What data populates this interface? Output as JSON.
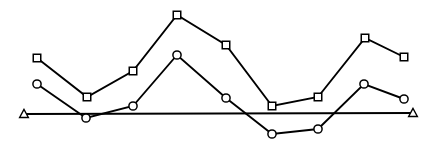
{
  "chart_data": {
    "type": "line",
    "title": "",
    "subtitle": "",
    "xlabel": "",
    "ylabel": "",
    "xlim": [
      0,
      437
    ],
    "ylim": [
      147,
      0
    ],
    "grid": false,
    "legend": "none",
    "axis_visible": false,
    "tick_labels_x": [],
    "tick_labels_y": [],
    "annotations": [],
    "background_color": "#ffffff",
    "line_color": "#000000",
    "marker_fill": "#ffffff",
    "series": [
      {
        "name": "series-squares",
        "marker": "square",
        "color": "#000000",
        "points": [
          {
            "x": 37,
            "y": 58
          },
          {
            "x": 87,
            "y": 97
          },
          {
            "x": 133,
            "y": 71
          },
          {
            "x": 177,
            "y": 15
          },
          {
            "x": 226,
            "y": 45
          },
          {
            "x": 272,
            "y": 106
          },
          {
            "x": 318,
            "y": 97
          },
          {
            "x": 365,
            "y": 38
          },
          {
            "x": 404,
            "y": 57
          }
        ],
        "values": [
          56,
          17,
          43,
          99,
          69,
          8,
          17,
          76,
          57
        ]
      },
      {
        "name": "series-circles",
        "marker": "circle",
        "color": "#000000",
        "points": [
          {
            "x": 37,
            "y": 84
          },
          {
            "x": 86,
            "y": 118
          },
          {
            "x": 133,
            "y": 106
          },
          {
            "x": 177,
            "y": 55
          },
          {
            "x": 226,
            "y": 98
          },
          {
            "x": 272,
            "y": 134
          },
          {
            "x": 318,
            "y": 129
          },
          {
            "x": 364,
            "y": 84
          },
          {
            "x": 404,
            "y": 99
          }
        ],
        "values": [
          30,
          -4,
          8,
          59,
          16,
          -20,
          -15,
          30,
          15
        ]
      },
      {
        "name": "series-triangles",
        "marker": "triangle",
        "color": "#000000",
        "points": [
          {
            "x": 24,
            "y": 114
          },
          {
            "x": 413,
            "y": 113
          }
        ],
        "values": [
          0,
          0
        ]
      }
    ]
  }
}
